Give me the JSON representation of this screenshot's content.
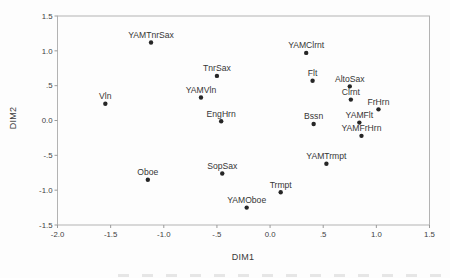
{
  "chart_data": {
    "type": "scatter",
    "title": "",
    "xlabel": "DIM1",
    "ylabel": "DIM2",
    "xlim": [
      -2.0,
      1.5
    ],
    "ylim": [
      -1.5,
      1.5
    ],
    "grid": false,
    "legend": false,
    "frame": "closed-box",
    "marker": "filled-circle",
    "x_ticks": [
      {
        "label": "-2.0",
        "value": -2.0
      },
      {
        "label": "-1.5",
        "value": -1.5
      },
      {
        "label": "-1.0",
        "value": -1.0
      },
      {
        "label": "-.5",
        "value": -0.5
      },
      {
        "label": "0.0",
        "value": 0.0
      },
      {
        "label": ".5",
        "value": 0.5
      },
      {
        "label": "1.0",
        "value": 1.0
      },
      {
        "label": "1.5",
        "value": 1.5
      }
    ],
    "y_ticks": [
      {
        "label": "1.5",
        "value": 1.5
      },
      {
        "label": "1.0",
        "value": 1.0
      },
      {
        "label": ".5",
        "value": 0.5
      },
      {
        "label": "0.0",
        "value": 0.0
      },
      {
        "label": "-.5",
        "value": -0.5
      },
      {
        "label": "-1.0",
        "value": -1.0
      },
      {
        "label": "-1.5",
        "value": -1.5
      }
    ],
    "points": [
      {
        "label": "YAMTnrSax",
        "x": -1.12,
        "y": 1.12
      },
      {
        "label": "Vln",
        "x": -1.55,
        "y": 0.24
      },
      {
        "label": "TnrSax",
        "x": -0.5,
        "y": 0.64
      },
      {
        "label": "YAMVln",
        "x": -0.65,
        "y": 0.33
      },
      {
        "label": "EngHrn",
        "x": -0.46,
        "y": -0.01
      },
      {
        "label": "Oboe",
        "x": -1.15,
        "y": -0.85
      },
      {
        "label": "SopSax",
        "x": -0.45,
        "y": -0.76
      },
      {
        "label": "YAMOboe",
        "x": -0.22,
        "y": -1.25
      },
      {
        "label": "Trmpt",
        "x": 0.1,
        "y": -1.03
      },
      {
        "label": "YAMTrmpt",
        "x": 0.53,
        "y": -0.62
      },
      {
        "label": "YAMClrnt",
        "x": 0.34,
        "y": 0.97
      },
      {
        "label": "Flt",
        "x": 0.4,
        "y": 0.57
      },
      {
        "label": "AltoSax",
        "x": 0.75,
        "y": 0.49
      },
      {
        "label": "Clrnt",
        "x": 0.76,
        "y": 0.3
      },
      {
        "label": "FrHrn",
        "x": 1.02,
        "y": 0.16
      },
      {
        "label": "Bssn",
        "x": 0.41,
        "y": -0.05
      },
      {
        "label": "YAMFlt",
        "x": 0.84,
        "y": -0.03
      },
      {
        "label": "YAMFrHrn",
        "x": 0.86,
        "y": -0.22
      }
    ],
    "colors": {
      "point": "#262626",
      "frame": "#b3b3b3",
      "tick": "#9a9a9a",
      "text": "#3a3a3a",
      "background": "#fdfdfd"
    }
  }
}
